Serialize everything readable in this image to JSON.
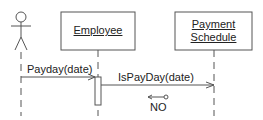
{
  "diagram": {
    "type": "UML sequence diagram",
    "actor": {
      "name": ""
    },
    "objects": [
      {
        "name": "Employee"
      },
      {
        "name_line1": "Payment",
        "name_line2": "Schedule"
      }
    ],
    "messages": [
      {
        "label": "Payday(date)",
        "from": "actor",
        "to": "Employee"
      },
      {
        "label": "IsPayDay(date)",
        "from": "Employee",
        "to": "Payment Schedule"
      }
    ],
    "return_data": {
      "label": "NO"
    },
    "colors": {
      "line": "#555555",
      "text": "#222222",
      "background": "#ffffff"
    }
  }
}
